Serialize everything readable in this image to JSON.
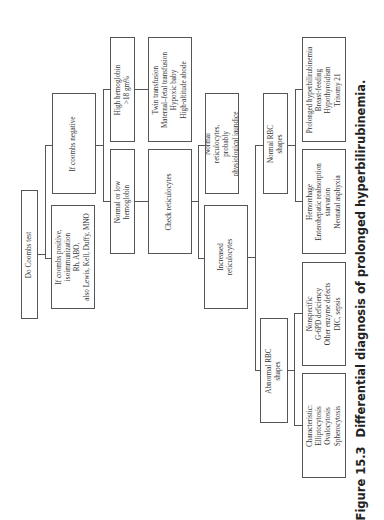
{
  "diagram": {
    "nodes": {
      "coombs_test": {
        "lines": [
          "Do Coombs test"
        ]
      },
      "coombs_positive": {
        "lines": [
          "If coombs positive,",
          "isoimmunization",
          "Rh, ABO,",
          "also Lewis, Kell, Duffy, MNO"
        ]
      },
      "coombs_negative": {
        "lines": [
          "If coombs negative"
        ]
      },
      "high_hemoglobin": {
        "lines": [
          "High hemoglobin",
          ">18 gm%"
        ]
      },
      "normal_low_hemoglobin": {
        "lines": [
          "Normal or low",
          "hemoglobin"
        ]
      },
      "high_hb_causes": {
        "lines": [
          "Twin transfusion",
          "Maternal–fetal transfusion",
          "Hypoxic baby",
          "High-altitude abode"
        ]
      },
      "check_reticulocytes": {
        "lines": [
          "Check reticulocytes"
        ]
      },
      "normal_reticulocytes": {
        "lines": [
          "Normal",
          "reticulocytes,",
          "probably",
          "physiological jaundice"
        ]
      },
      "increased_reticulocytes": {
        "lines": [
          "Increased",
          "reticulocytes"
        ]
      },
      "normal_rbc": {
        "lines": [
          "Normal RBC",
          "shapes"
        ]
      },
      "abnormal_rbc": {
        "lines": [
          "Abnormal RBC",
          "shapes"
        ]
      },
      "prolonged": {
        "lines": [
          "Prolonged hyperbilirubinemia",
          "Breast-feeding",
          "Hypothyroidism",
          "Trisomy 21"
        ]
      },
      "hemorrhage": {
        "lines": [
          "Hemorrhage",
          "Enterohepatic reabsorption",
          "starvation",
          "Neonatal asphyxia"
        ]
      },
      "nonspecific": {
        "lines": [
          "Nonspecific",
          "G-6PD deficiency",
          "Other enzyme defects",
          "DIC, sepsis"
        ]
      },
      "characteristic": {
        "lines": [
          "Characteristic:",
          "Elliptocytosis",
          "Ovalocytosis",
          "Spherocytosis"
        ]
      }
    }
  },
  "caption": {
    "figure_number": "Figure 15.3",
    "title": "Differential diagnosis of prolonged hyperbilirubinemia."
  },
  "colors": {
    "line": "#555555",
    "text": "#333333",
    "background": "#ffffff"
  }
}
